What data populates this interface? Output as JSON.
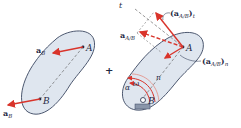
{
  "diagram": {
    "colors": {
      "body_fill": "#dfe6ef",
      "body_stroke": "#3a4660",
      "vector": "#d9342b",
      "text": "#1f2a44"
    },
    "left_panel": {
      "point_A": "A",
      "point_B": "B",
      "vector_at_A": {
        "base": "a",
        "sub": "B"
      },
      "vector_at_B": {
        "base": "a",
        "sub": "B"
      }
    },
    "operator": "+",
    "right_panel": {
      "point_A": "A",
      "point_B": "B",
      "axis_t": "t",
      "axis_n": "n",
      "omega": "ω",
      "alpha": "α",
      "vector_total": {
        "base": "a",
        "sub": "A/B"
      },
      "vector_tangential": {
        "open": "(",
        "base": "a",
        "sub": "A/B",
        "close": ")",
        "comp": "t"
      },
      "vector_normal": {
        "open": "(",
        "base": "a",
        "sub": "A/B",
        "close": ")",
        "comp": "n"
      }
    }
  }
}
